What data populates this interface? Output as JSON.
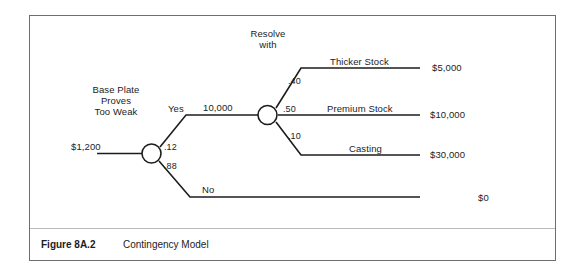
{
  "figure": {
    "caption_label": "Figure 8A.2",
    "caption_title": "Contingency Model"
  },
  "diagram": {
    "root_value": "$1,200",
    "decision_question": "Base Plate\nProves\nToo Weak",
    "decision_question_line1": "Base Plate",
    "decision_question_line2": "Proves",
    "decision_question_line3": "Too Weak",
    "chance_node_label_line1": "Resolve",
    "chance_node_label_line2": "with",
    "yes_branch_label": "Yes",
    "yes_branch_value": "10,000",
    "no_branch_label": "No",
    "yes_probability": ".12",
    "no_probability": ".88",
    "outcomes": [
      {
        "name": "Thicker Stock",
        "probability": ".40",
        "payoff": "$5,000"
      },
      {
        "name": "Premium Stock",
        "probability": ".50",
        "payoff": "$10,000"
      },
      {
        "name": "Casting",
        "probability": ".10",
        "payoff": "$30,000"
      }
    ],
    "no_payoff": "$0"
  },
  "colors": {
    "line": "#1c1c1c",
    "border": "#6e6e70",
    "separator": "#b9b9bb",
    "background": "#ffffff"
  }
}
